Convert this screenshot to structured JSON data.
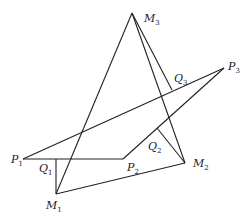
{
  "diagram": {
    "points": {
      "M3": {
        "x": 132,
        "y": 13
      },
      "P3": {
        "x": 224,
        "y": 68
      },
      "P1": {
        "x": 23,
        "y": 159
      },
      "P2": {
        "x": 123,
        "y": 159
      },
      "M2": {
        "x": 185,
        "y": 163
      },
      "M1": {
        "x": 56,
        "y": 194
      },
      "Q1": {
        "x": 56,
        "y": 159
      },
      "Q2": {
        "x": 157,
        "y": 128
      },
      "Q3": {
        "x": 172,
        "y": 90
      }
    },
    "labels": [
      {
        "id": "M3",
        "base": "M",
        "sub": "3",
        "x": 144,
        "y": 22
      },
      {
        "id": "P3",
        "base": "P",
        "sub": "3",
        "x": 228,
        "y": 70
      },
      {
        "id": "Q3",
        "base": "Q",
        "sub": "3",
        "x": 174,
        "y": 82
      },
      {
        "id": "Q2",
        "base": "Q",
        "sub": "2",
        "x": 148,
        "y": 150
      },
      {
        "id": "P1",
        "base": "P",
        "sub": "1",
        "x": 11,
        "y": 163
      },
      {
        "id": "Q1",
        "base": "Q",
        "sub": "1",
        "x": 39,
        "y": 172
      },
      {
        "id": "P2",
        "base": "P",
        "sub": "2",
        "x": 127,
        "y": 171
      },
      {
        "id": "M2",
        "base": "M",
        "sub": "2",
        "x": 193,
        "y": 167
      },
      {
        "id": "M1",
        "base": "M",
        "sub": "1",
        "x": 46,
        "y": 209
      }
    ],
    "segments": [
      [
        "P1",
        "P3"
      ],
      [
        "P1",
        "P2"
      ],
      [
        "P2",
        "P3"
      ],
      [
        "M1",
        "M2"
      ],
      [
        "M1",
        "M3"
      ],
      [
        "M2",
        "M3"
      ],
      [
        "M3",
        "Q3"
      ],
      [
        "M2",
        "Q2"
      ],
      [
        "M1",
        "Q1"
      ]
    ]
  }
}
